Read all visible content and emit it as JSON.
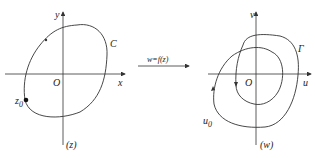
{
  "left_plane": {
    "x_axis_label": "x",
    "y_axis_label": "y",
    "origin_label": "O",
    "curve_label": "C",
    "point_label": "z",
    "point_subscript": "0",
    "plane_label": "(z)"
  },
  "mapping": {
    "label": "w=f(z)"
  },
  "right_plane": {
    "u_axis_label": "u",
    "v_axis_label": "v",
    "origin_label": "O",
    "curve_label": "Γ",
    "point_label": "u",
    "point_subscript": "0",
    "plane_label": "(w)"
  },
  "colors": {
    "stroke": "#333333",
    "background": "#ffffff"
  }
}
